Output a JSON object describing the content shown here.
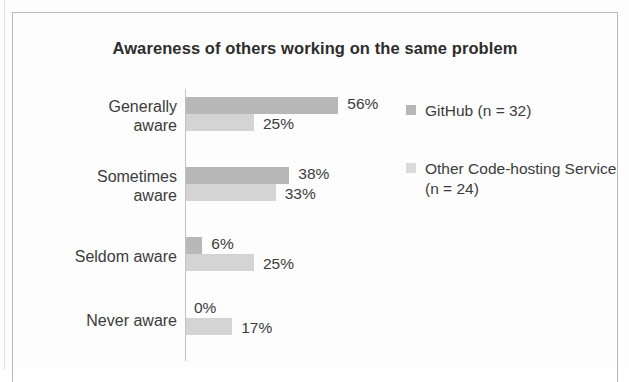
{
  "chart_data": {
    "type": "bar",
    "orientation": "horizontal",
    "title": "Awareness of others working on the same problem",
    "xlabel": "",
    "ylabel": "",
    "grid": false,
    "legend_position": "right",
    "xlim": [
      0,
      60
    ],
    "value_suffix": "%",
    "categories": [
      "Generally aware",
      "Sometimes aware",
      "Seldom aware",
      "Never aware"
    ],
    "series": [
      {
        "name": "GitHub (n = 32)",
        "color": "#b4b4b4",
        "values": [
          56,
          38,
          6,
          0
        ],
        "labels": [
          "56%",
          "25%",
          "6%",
          "0%"
        ]
      },
      {
        "name": "Other Code-hosting Service (n = 24)",
        "color": "#d7d7d7",
        "values": [
          25,
          33,
          25,
          17
        ],
        "labels": [
          "25%",
          "33%",
          "25%",
          "17%"
        ]
      }
    ],
    "bars": [
      {
        "category": "Generally aware",
        "lines": [
          "Generally",
          "aware"
        ],
        "github_value": 56,
        "github_label": "56%",
        "other_value": 25,
        "other_label": "25%"
      },
      {
        "category": "Sometimes aware",
        "lines": [
          "Sometimes",
          "aware"
        ],
        "github_value": 38,
        "github_label": "38%",
        "other_value": 33,
        "other_label": "33%"
      },
      {
        "category": "Seldom aware",
        "lines": [
          "Seldom aware"
        ],
        "github_value": 6,
        "github_label": "6%",
        "other_value": 25,
        "other_label": "25%"
      },
      {
        "category": "Never aware",
        "lines": [
          "Never aware"
        ],
        "github_value": 0,
        "github_label": "0%",
        "other_value": 17,
        "other_label": "17%"
      }
    ]
  },
  "legend": {
    "items": [
      {
        "label": "GitHub (n = 32)",
        "series": "github"
      },
      {
        "label": "Other Code-hosting Service (n = 24)",
        "series": "other"
      }
    ]
  },
  "labels": {
    "cat_0_line_0": "Generally",
    "cat_0_line_1": "aware",
    "cat_1_line_0": "Sometimes",
    "cat_1_line_1": "aware",
    "cat_2_line_0": "Seldom aware",
    "cat_3_line_0": "Never aware"
  }
}
